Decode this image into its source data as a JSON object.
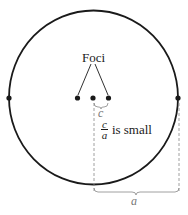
{
  "diagram": {
    "type": "ellipse-eccentricity",
    "labels": {
      "foci": "Foci",
      "c": "c",
      "a": "a",
      "ratio_numerator": "c",
      "ratio_denominator": "a",
      "ratio_text": "is small"
    },
    "colors": {
      "stroke": "#1a1a1a",
      "dashed": "#888888",
      "background": "#ffffff"
    }
  }
}
